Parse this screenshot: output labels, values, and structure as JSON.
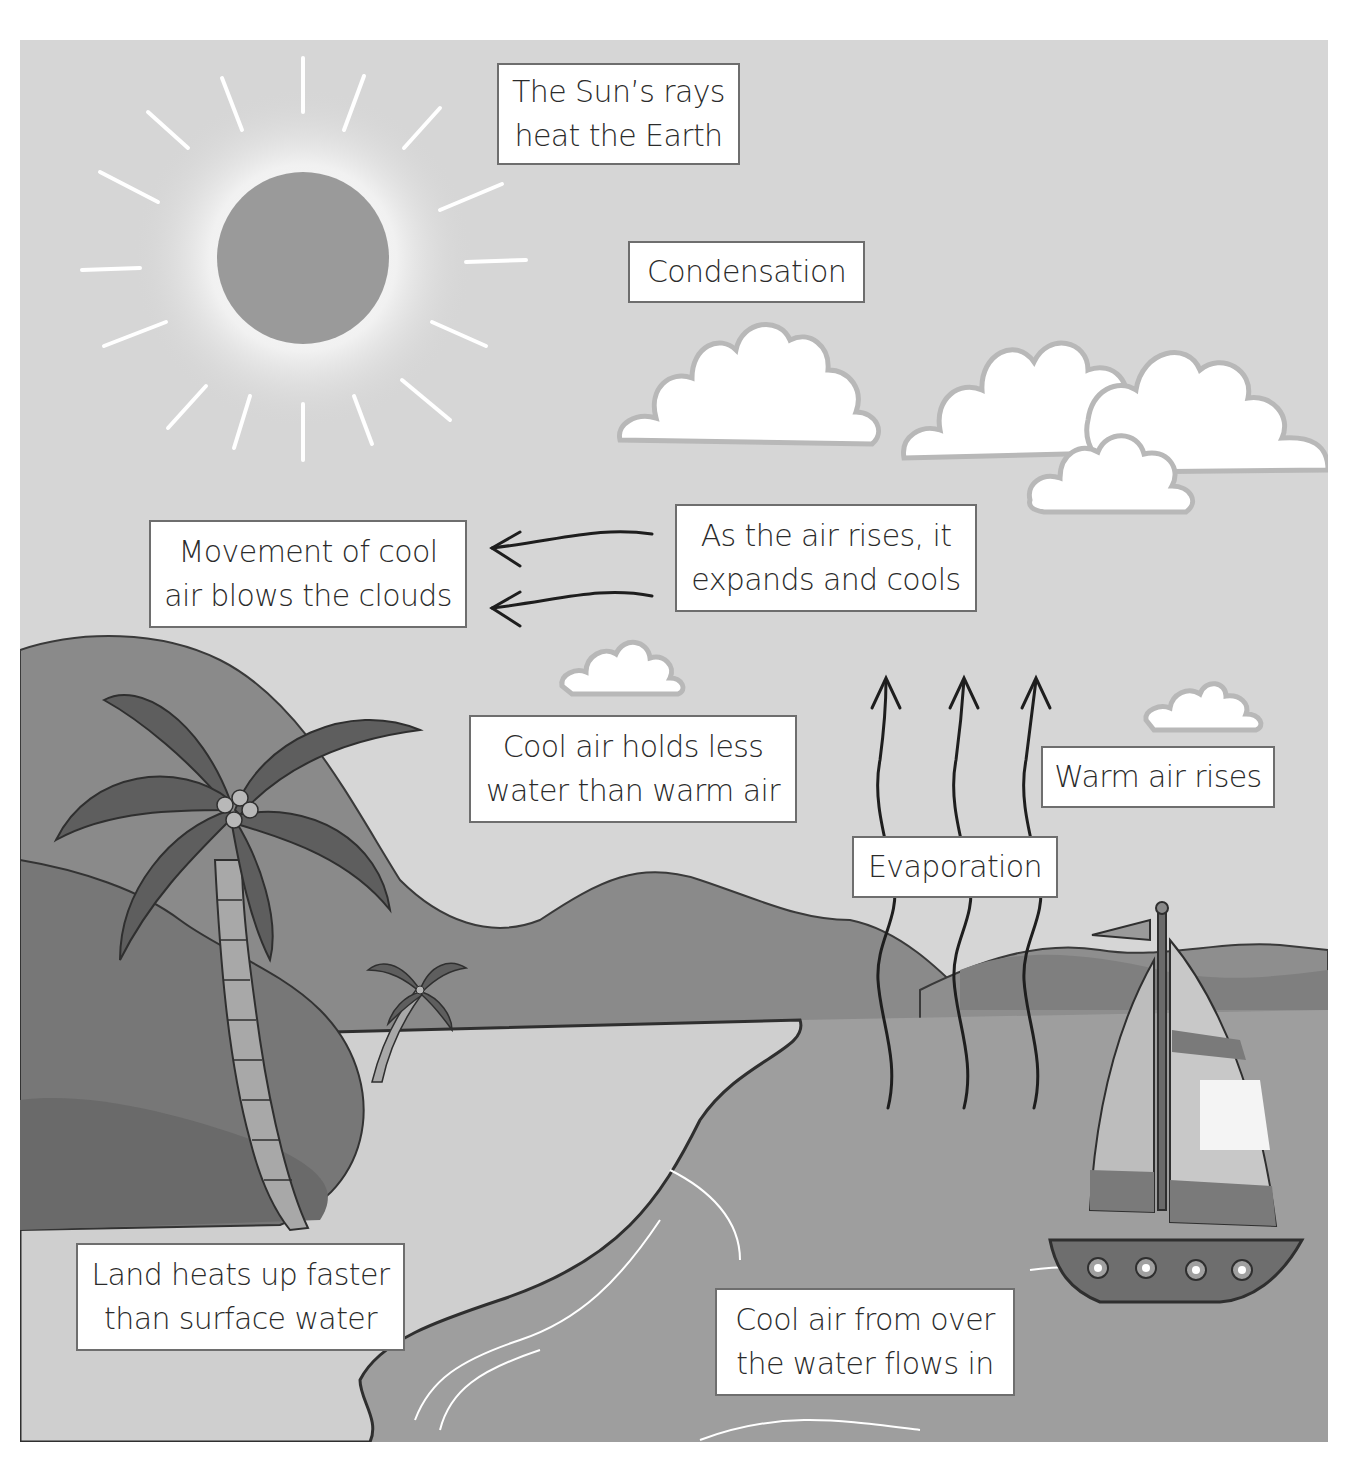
{
  "diagram": {
    "type": "sea-breeze-water-cycle-illustration",
    "colors": {
      "sky": "#d6d6d6",
      "sun": "#9a9a9a",
      "sun_glow": "#f2f2f2",
      "mountain_far": "#8a8a8a",
      "mountain_near": "#7c7c7c",
      "bush": "#777777",
      "sand": "#cfcfcf",
      "sea": "#9e9e9e",
      "cloud": "#ffffff",
      "label_border": "#6e6e6e",
      "text": "#2b2b2b"
    },
    "labels": {
      "sun_rays": {
        "line1": "The Sun’s rays",
        "line2": "heat the Earth"
      },
      "condensation": {
        "line1": "Condensation"
      },
      "movement": {
        "line1": "Movement of cool",
        "line2": "air blows the clouds"
      },
      "air_rises": {
        "line1": "As the air rises, it",
        "line2": "expands and cools"
      },
      "cool_air_holds": {
        "line1": "Cool air holds less",
        "line2": "water than warm air"
      },
      "warm_air": {
        "line1": "Warm air rises"
      },
      "evaporation": {
        "line1": "Evaporation"
      },
      "land_heats": {
        "line1": "Land heats up faster",
        "line2": "than surface water"
      },
      "cool_air_flows": {
        "line1": "Cool air from over",
        "line2": "the water flows in"
      }
    },
    "arrows": [
      {
        "from": "air_rises",
        "to": "movement",
        "direction": "left",
        "count": 2
      },
      {
        "from": "evaporation",
        "to": "sky",
        "direction": "up",
        "count": 3
      }
    ],
    "elements": [
      "sun",
      "clouds",
      "mountains",
      "palm-tree-large",
      "palm-tree-small",
      "bushes",
      "beach",
      "sea",
      "sailboat"
    ]
  }
}
